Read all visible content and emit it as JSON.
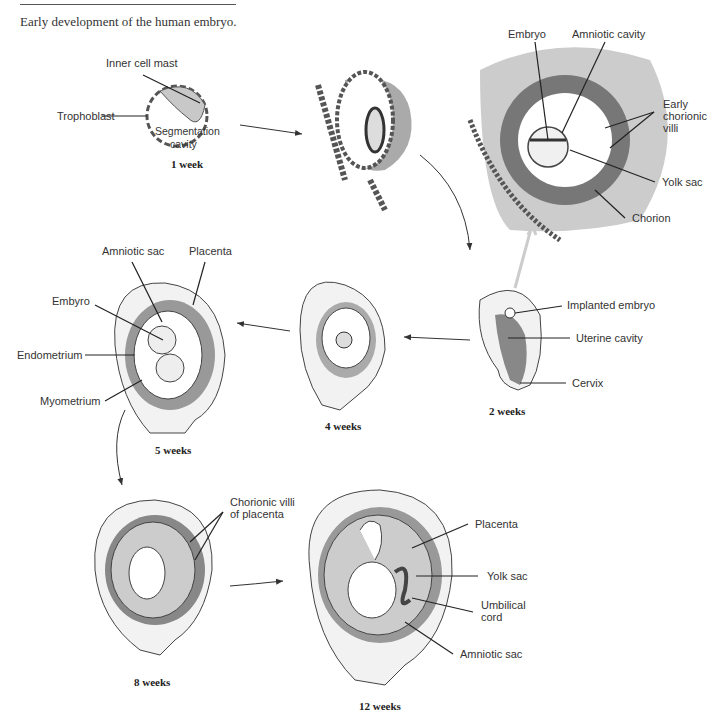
{
  "figure": {
    "caption": "Early development of the human embryo.",
    "stages": [
      {
        "id": "1-week",
        "label": "1 week",
        "labels": [
          "Inner cell mast",
          "Trophoblast",
          "Segmentation cavity"
        ]
      },
      {
        "id": "implantation",
        "label": "",
        "labels": []
      },
      {
        "id": "chorion-detail",
        "label": "",
        "labels": [
          "Embryo",
          "Amniotic cavity",
          "Early chorionic villi",
          "Yolk sac",
          "Chorion"
        ]
      },
      {
        "id": "2-weeks",
        "label": "2 weeks",
        "labels": [
          "Implanted embryo",
          "Uterine cavity",
          "Cervix"
        ]
      },
      {
        "id": "4-weeks",
        "label": "4 weeks",
        "labels": []
      },
      {
        "id": "5-weeks",
        "label": "5 weeks",
        "labels": [
          "Amniotic sac",
          "Placenta",
          "Embyro",
          "Endometrium",
          "Myometrium"
        ]
      },
      {
        "id": "8-weeks",
        "label": "8 weeks",
        "labels": [
          "Chorionic villi of placenta"
        ]
      },
      {
        "id": "12-weeks",
        "label": "12 weeks",
        "labels": [
          "Placenta",
          "Yolk sac",
          "Umbilical cord",
          "Amniotic sac"
        ]
      }
    ]
  },
  "labels": {
    "inner_cell_mast": "Inner cell mast",
    "trophoblast": "Trophoblast",
    "segmentation": "Segmentation",
    "cavity": "cavity",
    "week1": "1 week",
    "embryo": "Embryo",
    "amniotic_cavity": "Amniotic cavity",
    "early": "Early",
    "chorionic": "chorionic",
    "villi": "villi",
    "yolk_sac_top": "Yolk sac",
    "chorion": "Chorion",
    "implanted_embryo": "Implanted embryo",
    "uterine_cavity": "Uterine cavity",
    "cervix": "Cervix",
    "week2": "2 weeks",
    "week4": "4 weeks",
    "amniotic_sac_5": "Amniotic sac",
    "placenta_5": "Placenta",
    "embyro_5": "Embyro",
    "endometrium": "Endometrium",
    "myometrium": "Myometrium",
    "week5": "5 weeks",
    "chorionic_villi": "Chorionic villi",
    "of_placenta": "of placenta",
    "week8": "8 weeks",
    "placenta_12": "Placenta",
    "yolk_sac_12": "Yolk sac",
    "umbilical": "Umbilical",
    "cord": "cord",
    "amniotic_sac_12": "Amniotic sac",
    "week12": "12 weeks"
  }
}
